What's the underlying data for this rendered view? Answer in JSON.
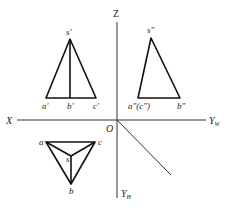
{
  "diagram": {
    "type": "orthographic-projection",
    "axes": {
      "z_label": "Z",
      "x_label": "X",
      "origin_label": "O",
      "yw_label": "Y",
      "yw_sub": "W",
      "yh_label": "Y",
      "yh_sub": "H"
    },
    "front_view": {
      "labels": {
        "apex": "s'",
        "left": "a'",
        "mid": "b'",
        "right": "c'"
      }
    },
    "side_view": {
      "labels": {
        "apex": "s\"",
        "left": "a\"(c\")",
        "right": "b\""
      }
    },
    "top_view": {
      "labels": {
        "a": "a",
        "c": "c",
        "s": "s",
        "b": "b"
      }
    }
  }
}
